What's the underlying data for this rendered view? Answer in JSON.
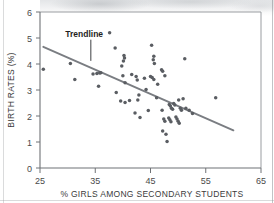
{
  "figure": {
    "background_color": "#ffffff",
    "frame_color": "#8d9094",
    "axis_color": "#6f7276",
    "point_color": "#5a5d62",
    "trendline_color": "#7a7d82"
  },
  "chart_data": {
    "type": "scatter",
    "title": "",
    "xlabel": "% GIRLS AMONG SECONDARY STUDENTS",
    "ylabel": "BIRTH RATES (%)",
    "xlim": [
      25,
      65
    ],
    "ylim": [
      0,
      6
    ],
    "xticks": [
      25,
      35,
      45,
      55,
      65
    ],
    "yticks": [
      0,
      1,
      2,
      3,
      4,
      5,
      6
    ],
    "xtick_labels": [
      "25",
      "35",
      "45",
      "55",
      "65"
    ],
    "ytick_labels": [
      "0",
      "1",
      "2",
      "3",
      "4",
      "5",
      "6"
    ],
    "grid": false,
    "legend": null,
    "annotations": [
      {
        "text": "Trendline",
        "x": 33.0,
        "y": 5.05,
        "leader_to_x": 34.2,
        "leader_to_y": 4.12
      }
    ],
    "trendline": {
      "name": "Trendline",
      "x_start": 25.6,
      "y_start": 4.66,
      "x_end": 60.0,
      "y_end": 1.45,
      "slope": -0.0933,
      "intercept": 7.05
    },
    "series": [
      {
        "name": "Countries",
        "marker": "circle",
        "points": [
          [
            25.6,
            3.8
          ],
          [
            30.5,
            4.02
          ],
          [
            31.3,
            3.4
          ],
          [
            34.6,
            3.62
          ],
          [
            35.3,
            3.63
          ],
          [
            35.8,
            3.65
          ],
          [
            36.0,
            3.66
          ],
          [
            35.6,
            3.14
          ],
          [
            37.6,
            5.2
          ],
          [
            38.6,
            4.62
          ],
          [
            38.8,
            2.9
          ],
          [
            40.1,
            4.12
          ],
          [
            40.2,
            4.33
          ],
          [
            40.3,
            4.23
          ],
          [
            39.8,
            3.92
          ],
          [
            40.0,
            3.55
          ],
          [
            40.4,
            3.28
          ],
          [
            39.6,
            2.58
          ],
          [
            40.4,
            2.52
          ],
          [
            41.6,
            3.6
          ],
          [
            41.2,
            2.6
          ],
          [
            42.6,
            3.38
          ],
          [
            42.4,
            3.52
          ],
          [
            42.9,
            2.81
          ],
          [
            42.7,
            2.62
          ],
          [
            42.2,
            2.12
          ],
          [
            43.1,
            1.94
          ],
          [
            43.9,
            3.45
          ],
          [
            44.2,
            3.02
          ],
          [
            44.6,
            2.21
          ],
          [
            45.2,
            4.72
          ],
          [
            45.6,
            4.3
          ],
          [
            45.5,
            4.16
          ],
          [
            45.7,
            4.02
          ],
          [
            45.3,
            3.48
          ],
          [
            45.6,
            3.4
          ],
          [
            45.0,
            3.52
          ],
          [
            46.3,
            3.22
          ],
          [
            46.1,
            2.7
          ],
          [
            47.0,
            3.78
          ],
          [
            47.2,
            3.72
          ],
          [
            47.6,
            3.55
          ],
          [
            47.1,
            2.22
          ],
          [
            47.4,
            1.88
          ],
          [
            47.6,
            1.8
          ],
          [
            47.2,
            1.42
          ],
          [
            47.8,
            1.3
          ],
          [
            48.0,
            1.02
          ],
          [
            48.4,
            2.44
          ],
          [
            48.6,
            2.38
          ],
          [
            48.8,
            2.3
          ],
          [
            49.0,
            2.26
          ],
          [
            49.2,
            2.48
          ],
          [
            49.4,
            2.42
          ],
          [
            48.3,
            1.92
          ],
          [
            48.5,
            1.86
          ],
          [
            48.7,
            1.78
          ],
          [
            49.6,
            1.96
          ],
          [
            49.8,
            1.88
          ],
          [
            50.0,
            1.8
          ],
          [
            50.2,
            1.72
          ],
          [
            50.4,
            2.3
          ],
          [
            50.6,
            2.22
          ],
          [
            50.1,
            2.62
          ],
          [
            50.9,
            2.66
          ],
          [
            51.4,
            2.3
          ],
          [
            52.0,
            2.22
          ],
          [
            52.6,
            2.1
          ],
          [
            51.2,
            4.2
          ],
          [
            56.8,
            2.7
          ]
        ]
      }
    ]
  }
}
